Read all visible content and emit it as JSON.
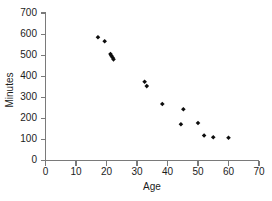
{
  "chart_data": {
    "type": "scatter",
    "title": "",
    "xlabel": "Age",
    "ylabel": "Minutes",
    "xlim": [
      0,
      70
    ],
    "ylim": [
      0,
      700
    ],
    "xticks": [
      0,
      10,
      20,
      30,
      40,
      50,
      60,
      70
    ],
    "yticks": [
      0,
      100,
      200,
      300,
      400,
      500,
      600,
      700
    ],
    "grid": false,
    "legend": null,
    "marker": "diamond",
    "marker_color": "#0d0d0d",
    "axis_color": "#7a7a7a",
    "series": [
      {
        "name": "Minutes vs Age",
        "points": [
          {
            "x": 17.2,
            "y": 585
          },
          {
            "x": 19.4,
            "y": 566
          },
          {
            "x": 21.3,
            "y": 505
          },
          {
            "x": 21.6,
            "y": 497
          },
          {
            "x": 22.0,
            "y": 489
          },
          {
            "x": 22.3,
            "y": 480
          },
          {
            "x": 32.5,
            "y": 374
          },
          {
            "x": 33.2,
            "y": 353
          },
          {
            "x": 38.3,
            "y": 268
          },
          {
            "x": 44.4,
            "y": 172
          },
          {
            "x": 45.2,
            "y": 243
          },
          {
            "x": 50.0,
            "y": 178
          },
          {
            "x": 52.0,
            "y": 119
          },
          {
            "x": 55.0,
            "y": 110
          },
          {
            "x": 60.0,
            "y": 108
          }
        ]
      }
    ]
  }
}
